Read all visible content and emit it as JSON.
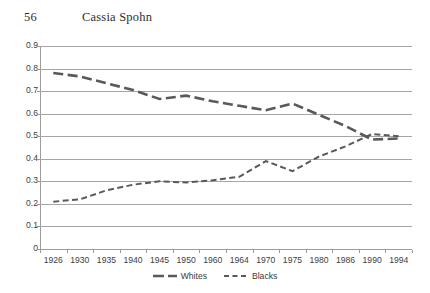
{
  "page": {
    "folio": "56",
    "running_title": "Cassia Spohn"
  },
  "chart_data": {
    "type": "line",
    "title": "",
    "subtitle": "",
    "xlabel": "",
    "ylabel": "",
    "categories": [
      "1926",
      "1930",
      "1935",
      "1940",
      "1945",
      "1950",
      "1960",
      "1964",
      "1970",
      "1975",
      "1980",
      "1986",
      "1990",
      "1994"
    ],
    "series": [
      {
        "name": "Whites",
        "style": "solid-thick-dash",
        "color": "#595959",
        "values": [
          0.78,
          0.765,
          0.735,
          0.705,
          0.665,
          0.68,
          0.655,
          0.635,
          0.615,
          0.645,
          0.595,
          0.545,
          0.485,
          0.49
        ]
      },
      {
        "name": "Blacks",
        "style": "dashed",
        "color": "#595959",
        "values": [
          0.21,
          0.22,
          0.26,
          0.285,
          0.3,
          0.295,
          0.305,
          0.32,
          0.39,
          0.345,
          0.41,
          0.455,
          0.51,
          0.5
        ]
      }
    ],
    "ylim": [
      0,
      0.9
    ],
    "yticks": [
      0,
      0.1,
      0.2,
      0.3,
      0.4,
      0.5,
      0.6,
      0.7,
      0.8,
      0.9
    ],
    "ytick_labels": [
      "0",
      "0.1",
      "0.2",
      "0.3",
      "0.4",
      "0.5",
      "0.6",
      "0.7",
      "0.8",
      "0.9"
    ],
    "grid": "horizontal",
    "legend_position": "bottom",
    "legend": [
      "Whites",
      "Blacks"
    ]
  }
}
